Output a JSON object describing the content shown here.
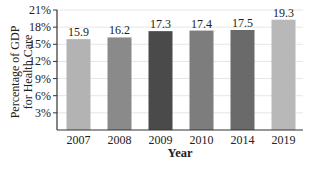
{
  "chart_data": {
    "type": "bar",
    "title": "",
    "xlabel": "Year",
    "ylabel": "Percentage of GDP for Health Care",
    "ylabel_lines": [
      "Percentage of GDP",
      "for Health Care"
    ],
    "categories": [
      "2007",
      "2008",
      "2009",
      "2010",
      "2014",
      "2019"
    ],
    "values": [
      15.9,
      16.2,
      17.3,
      17.4,
      17.5,
      19.3
    ],
    "value_labels": [
      "15.9",
      "16.2",
      "17.3",
      "17.4",
      "17.5",
      "19.3"
    ],
    "bar_colors": [
      "#b3b3b3",
      "#8a8a8a",
      "#4a4a4a",
      "#7d7d7d",
      "#6a6a6a",
      "#b8b8b8"
    ],
    "yticks": [
      3,
      6,
      9,
      12,
      15,
      18,
      21
    ],
    "ytick_labels": [
      "3%",
      "6%",
      "9%",
      "12%",
      "15%",
      "18%",
      "21%"
    ],
    "ylim": [
      0,
      21
    ],
    "grid": true,
    "legend": null
  }
}
